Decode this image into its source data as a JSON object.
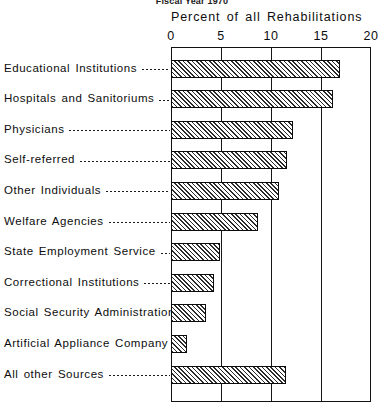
{
  "chart_data": {
    "type": "bar",
    "orientation": "horizontal",
    "title": "Fiscal Year 1970",
    "xlabel": "Percent of all Rehabilitations",
    "ylabel": "",
    "xlim": [
      0,
      20
    ],
    "xticks": [
      0,
      5,
      10,
      15,
      20
    ],
    "xtick_labels": [
      "0",
      "5",
      "10",
      "15",
      "20"
    ],
    "grid": true,
    "legend": null,
    "categories": [
      "Educational Institutions",
      "Hospitals and Sanitoriums",
      "Physicians",
      "Self-referred",
      "Other Individuals",
      "Welfare Agencies",
      "State Employment Service",
      "Correctional Institutions",
      "Social Security Administration",
      "Artificial Appliance Company",
      "All other Sources"
    ],
    "values": [
      16.8,
      16.1,
      12.1,
      11.5,
      10.7,
      8.6,
      4.8,
      4.2,
      3.4,
      1.5,
      11.4
    ]
  },
  "axis": {
    "title": "Percent of all Rehabilitations"
  },
  "header": {
    "title": "Fiscal Year 1970"
  }
}
